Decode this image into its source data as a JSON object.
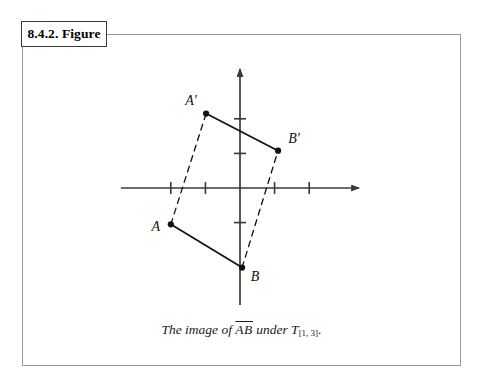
{
  "figure": {
    "tab_label": "8.4.2. Figure",
    "caption": {
      "lead": "The image of ",
      "segment": "AB",
      "middle": " under ",
      "transform_symbol": "T",
      "transform_subscript": "[1, 3]",
      "trailing": "."
    }
  },
  "chart_data": {
    "type": "scatter",
    "title": "",
    "subtitle": "",
    "xlabel": "",
    "ylabel": "",
    "xlim": [
      -3.5,
      3.5
    ],
    "ylim": [
      -3.5,
      3.5
    ],
    "grid": false,
    "legend": null,
    "axes": {
      "x_axis_label": "x-axis",
      "y_axis_label": "y-axis",
      "x_ticks": [
        -2,
        -1,
        1,
        2
      ],
      "y_ticks": [
        1,
        2,
        -1
      ],
      "tick_labels_shown": false,
      "arrow_heads": [
        "x-positive",
        "y-positive"
      ]
    },
    "points": [
      {
        "name": "A",
        "label": "A",
        "x": -2.0,
        "y": -1.05,
        "label_pos": "left"
      },
      {
        "name": "B",
        "label": "B",
        "x": 0.06,
        "y": -2.3,
        "label_pos": "right"
      },
      {
        "name": "A'",
        "label": "A′",
        "x": -0.98,
        "y": 2.15,
        "label_pos": "upleft"
      },
      {
        "name": "B'",
        "label": "B′",
        "x": 1.1,
        "y": 1.08,
        "label_pos": "upright"
      }
    ],
    "segments": [
      {
        "name": "AB",
        "from": "A",
        "to": "B",
        "style": "solid",
        "note": "original segment"
      },
      {
        "name": "A'B'",
        "from": "A′",
        "to": "B′",
        "style": "solid",
        "note": "image segment"
      },
      {
        "name": "AA'",
        "from": "A",
        "to": "A′",
        "style": "dashed",
        "note": "translation vector"
      },
      {
        "name": "BB'",
        "from": "B",
        "to": "B′",
        "style": "dashed",
        "note": "translation vector"
      }
    ],
    "annotations": [
      "Translation T[1,3] maps segment AB onto segment A'B'"
    ]
  },
  "colors": {
    "ink": "#111111",
    "axis": "#3a3a3a",
    "frame": "#9a9a9a",
    "tab_border": "#3a3a3a",
    "background": "#ffffff"
  }
}
